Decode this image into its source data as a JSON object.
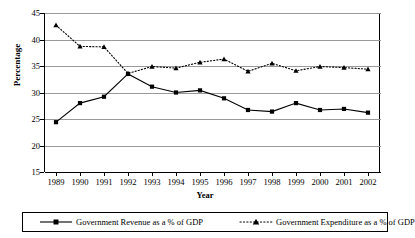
{
  "chart_data": {
    "type": "line",
    "title": "",
    "xlabel": "Year",
    "ylabel": "Percentage",
    "categories": [
      "1989",
      "1990",
      "1991",
      "1992",
      "1993",
      "1994",
      "1995",
      "1996",
      "1997",
      "1998",
      "1999",
      "2000",
      "2001",
      "2002"
    ],
    "ylim": [
      15,
      45
    ],
    "ytick_labels": [
      "45",
      "40",
      "35",
      "30",
      "25",
      "20",
      "15"
    ],
    "ytick_values": [
      45,
      40,
      35,
      30,
      25,
      20,
      15
    ],
    "grid": true,
    "legend_position": "bottom",
    "series": [
      {
        "name": "Government Revenue as a % of GDP",
        "marker": "square",
        "linestyle": "solid",
        "color": "#000000",
        "values": [
          24.4,
          28.0,
          29.2,
          33.5,
          31.1,
          30.0,
          30.4,
          28.9,
          26.7,
          26.4,
          28.0,
          26.7,
          26.9,
          26.2
        ]
      },
      {
        "name": "Government Expenditure as a % of GDP",
        "marker": "triangle",
        "linestyle": "dotted",
        "color": "#000000",
        "values": [
          42.7,
          38.7,
          38.6,
          33.6,
          34.9,
          34.6,
          35.7,
          36.3,
          34.0,
          35.5,
          34.1,
          34.9,
          34.7,
          34.4
        ]
      }
    ]
  },
  "legend": {
    "revenue_label": "Government Revenue as a % of GDP",
    "expenditure_label": "Government Expenditure as a % of GDP"
  },
  "axes": {
    "y_title": "Percentage",
    "x_title": "Year"
  }
}
